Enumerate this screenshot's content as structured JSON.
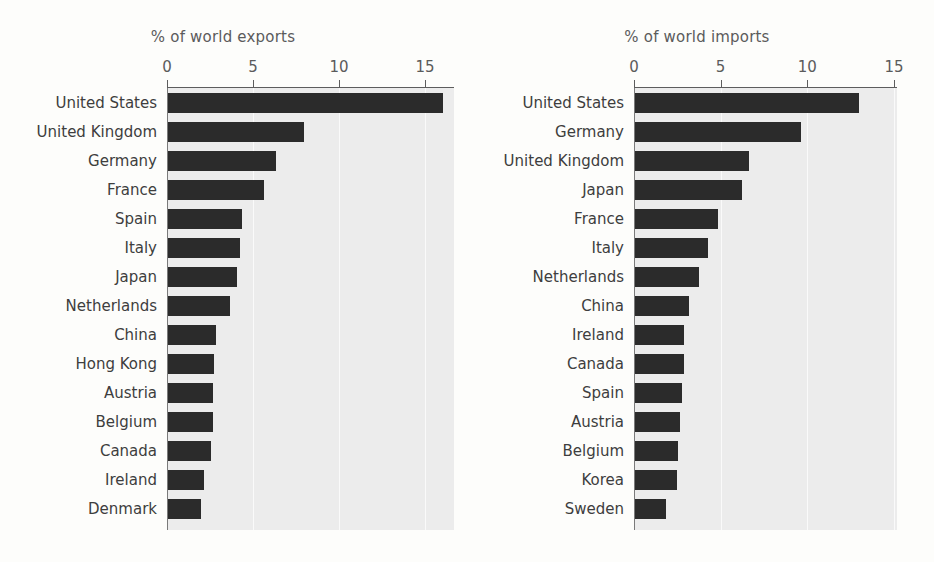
{
  "chart_data": [
    {
      "type": "bar",
      "orientation": "horizontal",
      "title": "% of world exports",
      "xlabel": "",
      "ylabel": "",
      "xlim": [
        0,
        16.7
      ],
      "xticks": [
        0,
        5,
        10,
        15
      ],
      "xtick_labels": [
        "0",
        "5",
        "10",
        "15"
      ],
      "grid": true,
      "legend": "none",
      "bar_color": "#2b2b2b",
      "plot_bg": "#ececec",
      "categories": [
        "United States",
        "United Kingdom",
        "Germany",
        "France",
        "Spain",
        "Italy",
        "Japan",
        "Netherlands",
        "China",
        "Hong Kong",
        "Austria",
        "Belgium",
        "Canada",
        "Ireland",
        "Denmark"
      ],
      "values": [
        16.0,
        7.9,
        6.3,
        5.6,
        4.3,
        4.2,
        4.0,
        3.6,
        2.8,
        2.7,
        2.6,
        2.6,
        2.5,
        2.1,
        1.9
      ]
    },
    {
      "type": "bar",
      "orientation": "horizontal",
      "title": "% of world imports",
      "xlabel": "",
      "ylabel": "",
      "xlim": [
        0,
        15.2
      ],
      "xticks": [
        0,
        5,
        10,
        15
      ],
      "xtick_labels": [
        "0",
        "5",
        "10",
        "15"
      ],
      "grid": true,
      "legend": "none",
      "bar_color": "#2b2b2b",
      "plot_bg": "#ececec",
      "categories": [
        "United States",
        "Germany",
        "United Kingdom",
        "Japan",
        "France",
        "Italy",
        "Netherlands",
        "China",
        "Ireland",
        "Canada",
        "Spain",
        "Austria",
        "Belgium",
        "Korea",
        "Sweden"
      ],
      "values": [
        12.9,
        9.6,
        6.6,
        6.2,
        4.8,
        4.2,
        3.7,
        3.1,
        2.8,
        2.8,
        2.7,
        2.6,
        2.5,
        2.4,
        1.8
      ]
    }
  ]
}
